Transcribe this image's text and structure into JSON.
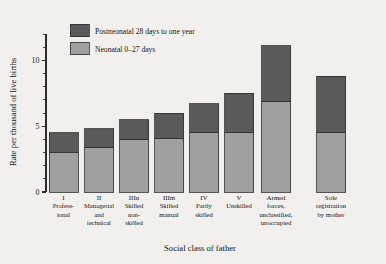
{
  "chart_data": {
    "type": "bar",
    "title": "",
    "subtitle": "",
    "xlabel": "Social class of father",
    "ylabel": "Rate per thousand of live births",
    "ylim": [
      0,
      12
    ],
    "yticks_major": [
      0,
      5,
      10
    ],
    "yticks_major_labels": [
      "0",
      "5",
      "10"
    ],
    "yticks_minor": [
      1,
      2,
      3,
      4,
      6,
      7,
      8,
      9,
      11,
      12
    ],
    "grid": false,
    "stacked": true,
    "legend_position": "top-left-inside",
    "categories": [
      "I Professional",
      "II Managerial and technical",
      "IIIn Skilled non-skilled",
      "IIIm Skilled manual",
      "IV Partly skilled",
      "V Unskilled",
      "Armed forces, unclassified, unoccupied",
      "Sole registration by mother"
    ],
    "category_labels": [
      [
        "I",
        "Profess-",
        "ional"
      ],
      [
        "II",
        "Managerial",
        "and",
        "technical"
      ],
      [
        "IIIn",
        "Skilled",
        "non-",
        "skilled"
      ],
      [
        "IIIm",
        "Skilled",
        "manual"
      ],
      [
        "IV",
        "Partly",
        "skilled"
      ],
      [
        "V",
        "Unskilled"
      ],
      [
        "Armed",
        "forces,",
        "unclassified,",
        "unoccupied"
      ],
      [
        "Sole",
        "registration",
        "by mother"
      ]
    ],
    "series": [
      {
        "name": "Neonatal 0–27 days",
        "color": "#a0a0a0",
        "values": [
          3.0,
          3.4,
          4.0,
          4.1,
          4.5,
          4.5,
          6.9,
          4.5
        ]
      },
      {
        "name": "Postneonatal 28 days to one year",
        "color": "#5a5a5a",
        "values": [
          1.5,
          1.4,
          1.5,
          1.9,
          2.2,
          3.0,
          4.2,
          4.3
        ]
      }
    ],
    "totals": [
      4.5,
      4.8,
      5.5,
      6.0,
      6.7,
      7.5,
      11.1,
      8.8
    ]
  },
  "legend": {
    "entries": [
      {
        "label": "Postneonatal 28 days to one year",
        "color": "#5a5a5a"
      },
      {
        "label": "Neonatal 0–27 days",
        "color": "#a0a0a0"
      }
    ]
  },
  "axes": {
    "y_title": "Rate per thousand of live births",
    "x_title": "Social class of father"
  },
  "colors": {
    "background": "#f2f0ec",
    "axis": "#2b2b2b",
    "postneonatal": "#5a5a5a",
    "neonatal": "#a0a0a0",
    "text": "#141414"
  }
}
